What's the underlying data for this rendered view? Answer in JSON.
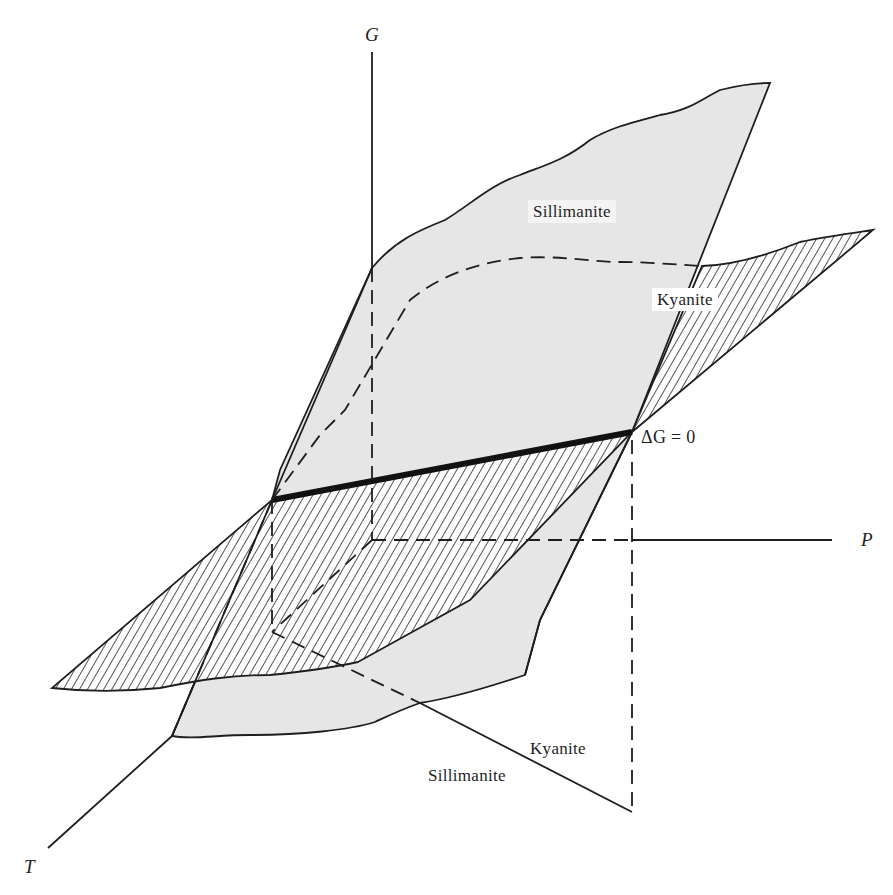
{
  "figure": {
    "axes": {
      "g_label": "G",
      "p_label": "P",
      "t_label": "T"
    },
    "labels": {
      "sillimanite_surface": "Sillimanite",
      "kyanite_surface": "Kyanite",
      "equilibrium": "ΔG = 0",
      "projection_kyanite": "Kyanite",
      "projection_sillimanite": "Sillimanite"
    },
    "colors": {
      "sillimanite_fill": "#e6e6e6",
      "kyanite_hatch": "#2a2a2a",
      "line": "#1e1e1e",
      "background": "#ffffff"
    }
  }
}
